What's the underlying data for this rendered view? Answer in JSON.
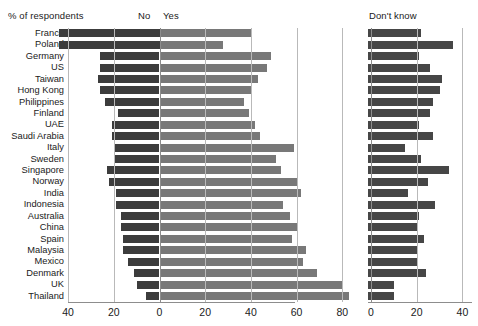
{
  "header": {
    "y_axis_title": "% of respondents",
    "label_no": "No",
    "label_yes": "Yes",
    "label_dont_know": "Don't know"
  },
  "chart_data": {
    "type": "bar",
    "title": "% of respondents",
    "subtype": "diverging-horizontal-bar + companion-bar",
    "xlabel": "",
    "ylabel": "",
    "grid": true,
    "legend_position": "top-inline",
    "categories": [
      "France",
      "Poland",
      "Germany",
      "US",
      "Taiwan",
      "Hong Kong",
      "Philippines",
      "Finland",
      "UAE",
      "Saudi Arabia",
      "Italy",
      "Sweden",
      "Singapore",
      "Norway",
      "India",
      "Indonesia",
      "Australia",
      "China",
      "Spain",
      "Malaysia",
      "Mexico",
      "Denmark",
      "UK",
      "Thailand"
    ],
    "panels": [
      {
        "name": "left",
        "series": [
          "No",
          "Yes"
        ],
        "xlim": [
          -44,
          85
        ],
        "ticks": [
          -40,
          -20,
          0,
          20,
          40,
          60,
          80
        ],
        "tick_labels": [
          "40",
          "20",
          "0",
          "20",
          "40",
          "60",
          "80"
        ]
      },
      {
        "name": "right",
        "series": [
          "Don't know"
        ],
        "xlim": [
          0,
          45
        ],
        "ticks": [
          0,
          20,
          40
        ],
        "tick_labels": [
          "0",
          "20",
          "40"
        ]
      }
    ],
    "series": [
      {
        "name": "No",
        "color": "#3c3c3c",
        "direction": "left",
        "values": [
          44,
          44,
          26,
          26,
          27,
          26,
          24,
          18,
          21,
          21,
          20,
          20,
          23,
          22,
          19,
          19,
          17,
          17,
          16,
          16,
          14,
          11,
          10,
          6
        ]
      },
      {
        "name": "Yes",
        "color": "#787878",
        "direction": "right",
        "values": [
          40,
          28,
          49,
          47,
          43,
          40,
          37,
          39,
          42,
          44,
          59,
          51,
          53,
          60,
          62,
          54,
          57,
          60,
          58,
          64,
          63,
          69,
          80,
          83
        ]
      },
      {
        "name": "Don't know",
        "color": "#464646",
        "direction": "right",
        "values": [
          22,
          36,
          21,
          26,
          31,
          30,
          27,
          26,
          21,
          27,
          15,
          22,
          34,
          25,
          16,
          28,
          21,
          20,
          23,
          20,
          20,
          24,
          10,
          10
        ]
      }
    ]
  }
}
